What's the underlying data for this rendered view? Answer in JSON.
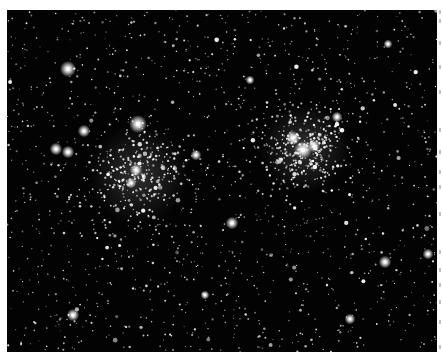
{
  "image": {
    "subject": "Double star cluster field (two open clusters) on black sky",
    "background_color": "#030303",
    "page_background": "#ffffff",
    "frame": {
      "x": 7,
      "y": 10,
      "width": 430,
      "height": 342
    }
  },
  "clusters": [
    {
      "name": "left-cluster",
      "cx": 138,
      "cy": 175,
      "radius": 55,
      "stars": 260
    },
    {
      "name": "right-cluster",
      "cx": 305,
      "cy": 148,
      "radius": 50,
      "stars": 320
    }
  ],
  "bright_stars": [
    {
      "x": 68,
      "y": 69,
      "r": 4.5
    },
    {
      "x": 138,
      "y": 124,
      "r": 5
    },
    {
      "x": 84,
      "y": 131,
      "r": 3.5
    },
    {
      "x": 56,
      "y": 149,
      "r": 3.5
    },
    {
      "x": 68,
      "y": 152,
      "r": 3.5
    },
    {
      "x": 196,
      "y": 155,
      "r": 3
    },
    {
      "x": 136,
      "y": 170,
      "r": 3.5
    },
    {
      "x": 131,
      "y": 183,
      "r": 3
    },
    {
      "x": 293,
      "y": 138,
      "r": 4
    },
    {
      "x": 303,
      "y": 150,
      "r": 5
    },
    {
      "x": 314,
      "y": 146,
      "r": 3.5
    },
    {
      "x": 337,
      "y": 117,
      "r": 3
    },
    {
      "x": 232,
      "y": 223,
      "r": 3.5
    },
    {
      "x": 250,
      "y": 80,
      "r": 2.5
    },
    {
      "x": 385,
      "y": 262,
      "r": 3.5
    },
    {
      "x": 73,
      "y": 315,
      "r": 3.5
    },
    {
      "x": 350,
      "y": 319,
      "r": 3
    },
    {
      "x": 205,
      "y": 295,
      "r": 2.5
    },
    {
      "x": 388,
      "y": 44,
      "r": 2.5
    },
    {
      "x": 428,
      "y": 254,
      "r": 3
    }
  ],
  "field": {
    "stars": 1400,
    "seed": 869884
  },
  "margin_strip": {
    "fragments": [
      10,
      19,
      41,
      65,
      90,
      128,
      150,
      170,
      185,
      212,
      250,
      268,
      283,
      300,
      320,
      345
    ]
  }
}
